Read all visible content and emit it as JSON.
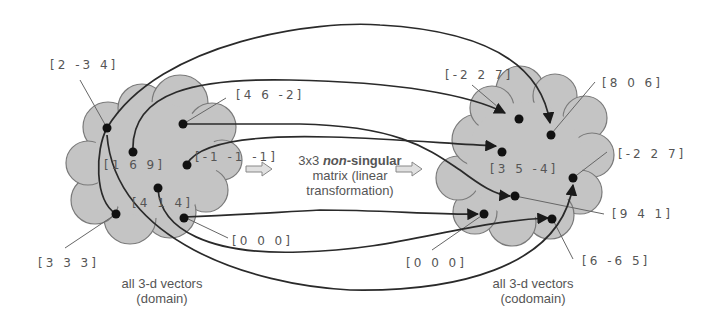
{
  "domain_set": {
    "caption_line1": "all 3-d vectors",
    "caption_line2": "(domain)",
    "vectors": [
      "[2 -3 4]",
      "[4 6 -2]",
      "[1 6 9]",
      "[-1 -1 -1]",
      "[4 1 4]",
      "[0 0 0]",
      "[3 3 3]"
    ]
  },
  "codomain_set": {
    "caption_line1": "all 3-d vectors",
    "caption_line2": "(codomain)",
    "vectors": [
      "[-2 2 7]",
      "[8 0 6]",
      "[-2 2 7]",
      "[3 5 -4]",
      "[9 4 1]",
      "[6 -6 5]",
      "[0 0 0]"
    ]
  },
  "transformation": {
    "prefix": "3x3 ",
    "emphasis": "non",
    "suffix": "-singular",
    "line2": "matrix (linear",
    "line3": "transformation)"
  },
  "colors": {
    "cloud_fill": "#c4c4c4",
    "cloud_stroke": "#7a7a7a",
    "line": "#2a2a2a",
    "label_text": "#555555"
  }
}
